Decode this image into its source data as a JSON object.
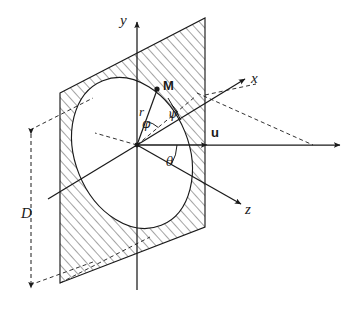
{
  "figure": {
    "kind": "3d-geometry-diagram",
    "background_color": "#ffffff",
    "line_color": "#1a1a1a",
    "hatch_color": "#1a1a1a"
  },
  "axes": [
    {
      "id": "y-axis",
      "label": "y",
      "style": "italic",
      "direction": "up",
      "arrow": true
    },
    {
      "id": "x-axis",
      "label": "x",
      "style": "italic",
      "direction": "upper-right",
      "arrow": true
    },
    {
      "id": "z-axis",
      "label": "z",
      "style": "italic",
      "direction": "lower-right",
      "arrow": true
    }
  ],
  "vectors": [
    {
      "id": "u-vector",
      "label": "u",
      "style": "bold",
      "direction": "right",
      "arrow": true
    },
    {
      "id": "r-vector",
      "label": "r",
      "style": "italic",
      "from": "origin",
      "to": "point-M",
      "arrow": false
    }
  ],
  "points": [
    {
      "id": "point-M",
      "label": "M",
      "style": "bold",
      "marker": "filled-dot"
    },
    {
      "id": "origin",
      "label": "",
      "style": "bold",
      "marker": "filled-dot"
    }
  ],
  "angles": [
    {
      "id": "angle-phi",
      "label": "φ",
      "between": [
        "r-vector",
        "projection-line"
      ]
    },
    {
      "id": "angle-psi",
      "label": "ψ",
      "between": [
        "projection-line",
        "plane-normal-ref"
      ]
    },
    {
      "id": "angle-theta",
      "label": "θ",
      "between": [
        "u-vector",
        "z-axis"
      ]
    }
  ],
  "dimensions": [
    {
      "id": "dimension-D",
      "label": "D",
      "style": "italic",
      "orientation": "vertical",
      "arrows": "both-ends",
      "line_style": "dashed"
    }
  ],
  "shapes": [
    {
      "id": "aperture-plane",
      "kind": "parallelogram",
      "fill": "hatched",
      "stroke": "solid"
    },
    {
      "id": "aperture-ellipse",
      "kind": "ellipse",
      "fill": "white",
      "stroke": "solid"
    }
  ],
  "guides": [
    {
      "id": "guide-dashed-projection",
      "line_style": "dashed"
    },
    {
      "id": "guide-dashed-far-right",
      "line_style": "dashed"
    },
    {
      "id": "guide-dashed-plane-back",
      "line_style": "dashed"
    }
  ]
}
